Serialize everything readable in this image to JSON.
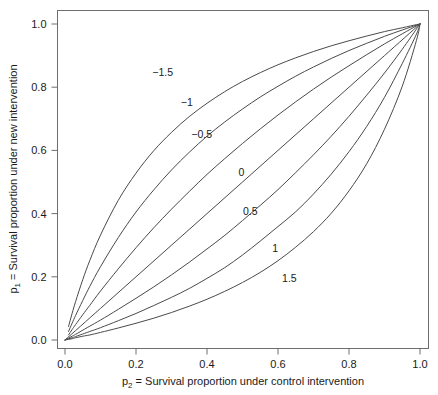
{
  "chart_data": {
    "type": "line",
    "title": "",
    "xlabel": "p2 = Survival proportion under control intervention",
    "ylabel": "p1 = Survival proportion under new intervention",
    "xlabel_prefix": "p",
    "xlabel_subscript": "2",
    "xlabel_rest": " = Survival proportion under control intervention",
    "ylabel_prefix": "p",
    "ylabel_subscript": "1",
    "ylabel_rest": " = Survival proportion under new intervention",
    "xlim": [
      0.0,
      1.0
    ],
    "ylim": [
      0.0,
      1.0
    ],
    "xticks": [
      "0.0",
      "0.2",
      "0.4",
      "0.6",
      "0.8",
      "1.0"
    ],
    "xtick_values": [
      0.0,
      0.2,
      0.4,
      0.6,
      0.8,
      1.0
    ],
    "yticks": [
      "0.0",
      "0.2",
      "0.4",
      "0.6",
      "0.8",
      "1.0"
    ],
    "ytick_values": [
      0.0,
      0.2,
      0.4,
      0.6,
      0.8,
      1.0
    ],
    "grid": false,
    "legend": "inline-curve-labels",
    "relation": "logit(p1) = logit(p2) - theta",
    "series": [
      {
        "name": "-1.5",
        "label": "−1.5",
        "theta": -1.5,
        "label_x": 0.275,
        "label_y": 0.835,
        "x": [
          0.01,
          0.02,
          0.03,
          0.05,
          0.07,
          0.1,
          0.15,
          0.2,
          0.25,
          0.3,
          0.35,
          0.4,
          0.45,
          0.5,
          0.55,
          0.6,
          0.65,
          0.7,
          0.75,
          0.8,
          0.85,
          0.9,
          0.95,
          0.99,
          1.0
        ],
        "y": [
          0.043,
          0.084,
          0.122,
          0.191,
          0.252,
          0.332,
          0.442,
          0.528,
          0.599,
          0.657,
          0.707,
          0.749,
          0.786,
          0.818,
          0.846,
          0.871,
          0.893,
          0.913,
          0.931,
          0.947,
          0.962,
          0.976,
          0.988,
          0.998,
          1.0
        ]
      },
      {
        "name": "-1",
        "label": "−1",
        "theta": -1.0,
        "label_x": 0.343,
        "label_y": 0.74,
        "x": [
          0.01,
          0.02,
          0.03,
          0.05,
          0.07,
          0.1,
          0.15,
          0.2,
          0.25,
          0.3,
          0.35,
          0.4,
          0.45,
          0.5,
          0.55,
          0.6,
          0.65,
          0.7,
          0.75,
          0.8,
          0.85,
          0.9,
          0.95,
          0.99,
          1.0
        ],
        "y": [
          0.027,
          0.053,
          0.078,
          0.125,
          0.17,
          0.232,
          0.324,
          0.405,
          0.475,
          0.538,
          0.594,
          0.645,
          0.69,
          0.731,
          0.769,
          0.803,
          0.835,
          0.864,
          0.891,
          0.916,
          0.939,
          0.961,
          0.981,
          0.996,
          1.0
        ]
      },
      {
        "name": "-0.5",
        "label": "−0.5",
        "theta": -0.5,
        "label_x": 0.385,
        "label_y": 0.64,
        "x": [
          0.01,
          0.02,
          0.03,
          0.05,
          0.07,
          0.1,
          0.15,
          0.2,
          0.25,
          0.3,
          0.35,
          0.4,
          0.45,
          0.5,
          0.55,
          0.6,
          0.65,
          0.7,
          0.75,
          0.8,
          0.85,
          0.9,
          0.95,
          0.99,
          1.0
        ],
        "y": [
          0.016,
          0.033,
          0.049,
          0.08,
          0.11,
          0.155,
          0.225,
          0.292,
          0.355,
          0.414,
          0.47,
          0.524,
          0.574,
          0.622,
          0.668,
          0.712,
          0.754,
          0.794,
          0.832,
          0.868,
          0.903,
          0.937,
          0.969,
          0.994,
          1.0
        ]
      },
      {
        "name": "0",
        "label": "0",
        "theta": 0.0,
        "label_x": 0.497,
        "label_y": 0.52,
        "x": [
          0.0,
          0.1,
          0.2,
          0.3,
          0.4,
          0.5,
          0.6,
          0.7,
          0.8,
          0.9,
          1.0
        ],
        "y": [
          0.0,
          0.1,
          0.2,
          0.3,
          0.4,
          0.5,
          0.6,
          0.7,
          0.8,
          0.9,
          1.0
        ]
      },
      {
        "name": "0.5",
        "label": "0.5",
        "theta": 0.5,
        "label_x": 0.522,
        "label_y": 0.395,
        "x": [
          0.0,
          0.01,
          0.02,
          0.03,
          0.05,
          0.07,
          0.1,
          0.15,
          0.2,
          0.25,
          0.3,
          0.35,
          0.4,
          0.45,
          0.5,
          0.55,
          0.6,
          0.65,
          0.7,
          0.75,
          0.8,
          0.85,
          0.9,
          0.95,
          0.99,
          1.0
        ],
        "y": [
          0.0,
          0.006,
          0.012,
          0.018,
          0.031,
          0.044,
          0.063,
          0.097,
          0.132,
          0.168,
          0.206,
          0.246,
          0.288,
          0.331,
          0.378,
          0.426,
          0.476,
          0.53,
          0.586,
          0.645,
          0.708,
          0.775,
          0.845,
          0.92,
          0.984,
          1.0
        ]
      },
      {
        "name": "1",
        "label": "1",
        "theta": 1.0,
        "label_x": 0.592,
        "label_y": 0.278,
        "x": [
          0.0,
          0.01,
          0.02,
          0.03,
          0.05,
          0.07,
          0.1,
          0.15,
          0.2,
          0.25,
          0.3,
          0.35,
          0.4,
          0.45,
          0.5,
          0.55,
          0.6,
          0.65,
          0.7,
          0.75,
          0.8,
          0.85,
          0.9,
          0.95,
          0.99,
          1.0
        ],
        "y": [
          0.0,
          0.004,
          0.007,
          0.011,
          0.019,
          0.027,
          0.039,
          0.061,
          0.084,
          0.109,
          0.135,
          0.163,
          0.195,
          0.229,
          0.269,
          0.313,
          0.359,
          0.406,
          0.462,
          0.525,
          0.596,
          0.676,
          0.768,
          0.875,
          0.968,
          1.0
        ]
      },
      {
        "name": "1.5",
        "label": "1.5",
        "theta": 1.5,
        "label_x": 0.632,
        "label_y": 0.185,
        "x": [
          0.0,
          0.01,
          0.02,
          0.03,
          0.05,
          0.07,
          0.1,
          0.15,
          0.2,
          0.25,
          0.3,
          0.35,
          0.4,
          0.45,
          0.5,
          0.55,
          0.6,
          0.65,
          0.7,
          0.75,
          0.8,
          0.85,
          0.9,
          0.95,
          0.99,
          1.0
        ],
        "y": [
          0.0,
          0.002,
          0.004,
          0.007,
          0.012,
          0.016,
          0.024,
          0.038,
          0.053,
          0.069,
          0.087,
          0.107,
          0.129,
          0.154,
          0.182,
          0.214,
          0.251,
          0.294,
          0.343,
          0.401,
          0.472,
          0.558,
          0.667,
          0.803,
          0.948,
          1.0
        ]
      }
    ]
  },
  "style": {
    "curve_color": "#4a4a4a",
    "axis_color": "#6e6e6e",
    "text_color": "#1a1a1a",
    "background": "#ffffff"
  }
}
